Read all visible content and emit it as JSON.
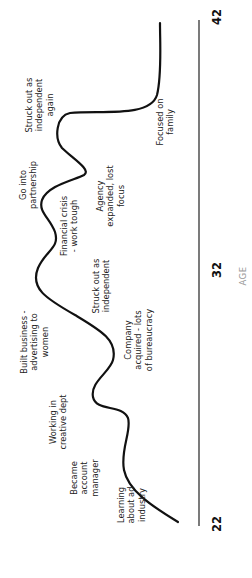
{
  "diagram": {
    "type": "life-line",
    "orientation": "rotated-90-ccw",
    "axis": {
      "title": "AGE",
      "ticks": [
        {
          "label": "22",
          "y": 524
        },
        {
          "label": "32",
          "y": 270
        },
        {
          "label": "42",
          "y": 17
        }
      ]
    },
    "events": [
      {
        "id": "e1",
        "label_lines": [
          "Learning",
          "about ad",
          "industry"
        ],
        "cx": 131,
        "cy": 505
      },
      {
        "id": "e2",
        "label_lines": [
          "Became",
          "account",
          "manager"
        ],
        "cx": 84,
        "cy": 478
      },
      {
        "id": "e3",
        "label_lines": [
          "Working in",
          "creative dept"
        ],
        "cx": 58,
        "cy": 422
      },
      {
        "id": "e4",
        "label_lines": [
          "Company",
          "acquired - lots",
          "of bureaucracy"
        ],
        "cx": 138,
        "cy": 340
      },
      {
        "id": "e5",
        "label_lines": [
          "Built business -",
          "advertising to",
          "women"
        ],
        "cx": 34,
        "cy": 342
      },
      {
        "id": "e6",
        "label_lines": [
          "Struck out as",
          "independent"
        ],
        "cx": 101,
        "cy": 286
      },
      {
        "id": "e7",
        "label_lines": [
          "Financial crisis",
          "- work tough"
        ],
        "cx": 69,
        "cy": 226
      },
      {
        "id": "e8",
        "label_lines": [
          "Go into",
          "partnership"
        ],
        "cx": 28,
        "cy": 185
      },
      {
        "id": "e9",
        "label_lines": [
          "Agency",
          "expanded, lost",
          "focus"
        ],
        "cx": 110,
        "cy": 196
      },
      {
        "id": "e10",
        "label_lines": [
          "Struck out as",
          "independent",
          "again"
        ],
        "cx": 39,
        "cy": 105
      },
      {
        "id": "e11",
        "label_lines": [
          "Focused on",
          "family"
        ],
        "cx": 165,
        "cy": 122
      }
    ]
  },
  "chart_data": {
    "type": "line",
    "title": "",
    "xlabel": "AGE",
    "ylabel": "",
    "x_ticks": [
      "22",
      "32",
      "42"
    ],
    "xlim": [
      22,
      42
    ],
    "grid": false,
    "annotations": [
      "Learning about ad industry",
      "Became account manager",
      "Working in creative dept",
      "Company acquired - lots of bureaucracy",
      "Built business - advertising to women",
      "Struck out as independent",
      "Financial crisis - work tough",
      "Go into partnership",
      "Agency expanded, lost focus",
      "Struck out as independent again",
      "Focused on family"
    ]
  }
}
